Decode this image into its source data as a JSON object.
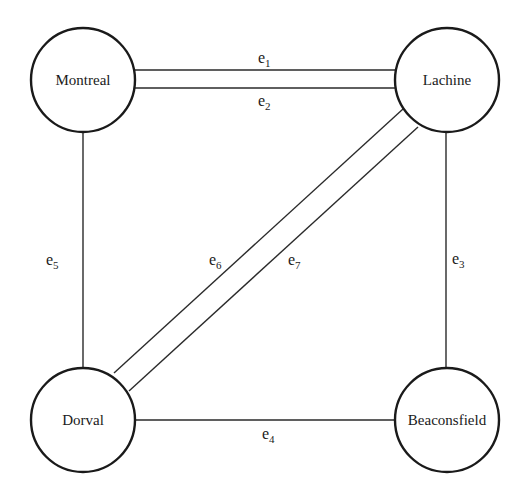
{
  "diagram": {
    "type": "undirected multigraph",
    "nodes": [
      {
        "id": "montreal",
        "label": "Montreal",
        "cx": 83,
        "cy": 80,
        "r": 52
      },
      {
        "id": "lachine",
        "label": "Lachine",
        "cx": 447,
        "cy": 80,
        "r": 52
      },
      {
        "id": "dorval",
        "label": "Dorval",
        "cx": 83,
        "cy": 420,
        "r": 52
      },
      {
        "id": "beaconsfield",
        "label": "Beaconsfield",
        "cx": 447,
        "cy": 420,
        "r": 52
      }
    ],
    "edges": [
      {
        "id": "e1",
        "base": "e",
        "sub": "1",
        "from": "Montreal",
        "to": "Lachine"
      },
      {
        "id": "e2",
        "base": "e",
        "sub": "2",
        "from": "Montreal",
        "to": "Lachine"
      },
      {
        "id": "e3",
        "base": "e",
        "sub": "3",
        "from": "Lachine",
        "to": "Beaconsfield"
      },
      {
        "id": "e4",
        "base": "e",
        "sub": "4",
        "from": "Dorval",
        "to": "Beaconsfield"
      },
      {
        "id": "e5",
        "base": "e",
        "sub": "5",
        "from": "Montreal",
        "to": "Dorval"
      },
      {
        "id": "e6",
        "base": "e",
        "sub": "6",
        "from": "Dorval",
        "to": "Lachine"
      },
      {
        "id": "e7",
        "base": "e",
        "sub": "7",
        "from": "Dorval",
        "to": "Lachine"
      }
    ]
  }
}
